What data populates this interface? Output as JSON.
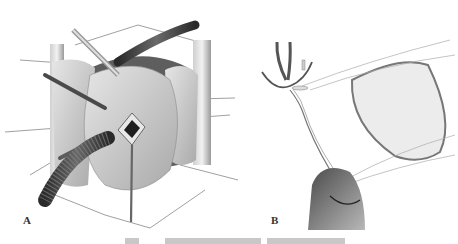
{
  "figure": {
    "panels": [
      {
        "id": "A",
        "label": "A",
        "description": "Surgical view of heart with cannulae, retractors and exposed valve opening"
      },
      {
        "id": "B",
        "label": "B",
        "description": "Suture passed through ring prosthesis using forceps/needle holder"
      }
    ],
    "caption": {
      "visible": false,
      "note": "caption cropped at bottom edge; text not legible"
    },
    "colors": {
      "background": "#ffffff",
      "tissue_light": "#d9d9d9",
      "tissue_mid": "#a8a8a8",
      "tube_dark": "#3a3a3a",
      "line": "#6a6a6a"
    }
  }
}
